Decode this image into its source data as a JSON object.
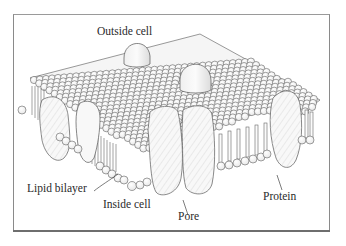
{
  "figure": {
    "type": "cell membrane cross-section diagram",
    "labels": {
      "outside": "Outside cell",
      "inside": "Inside cell",
      "bilayer": "Lipid bilayer",
      "pore": "Pore",
      "protein": "Protein"
    },
    "colors": {
      "stroke": "#4a4a4a",
      "head_fill": "#f4f4f4",
      "protein_fill": "#f7f7f7",
      "hatch": "#cfcfcf",
      "frame": "#8a8a8a"
    }
  }
}
